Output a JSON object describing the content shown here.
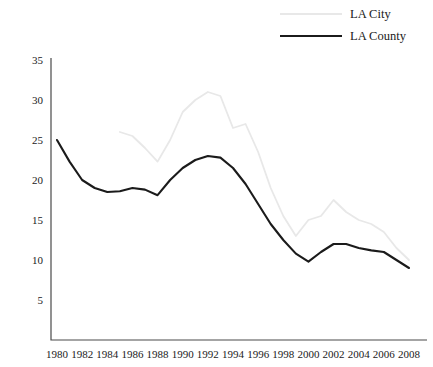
{
  "legend": {
    "items": [
      {
        "label": "LA City",
        "color": "#e8e8e8",
        "key": "la_city"
      },
      {
        "label": "LA County",
        "color": "#1b1b1b",
        "key": "la_county"
      }
    ]
  },
  "axes": {
    "y_ticks": [
      "5",
      "10",
      "15",
      "20",
      "25",
      "30",
      "35"
    ],
    "x_ticks": [
      "1980",
      "1982",
      "1984",
      "1986",
      "1988",
      "1990",
      "1992",
      "1994",
      "1996",
      "1998",
      "2000",
      "2002",
      "2004",
      "2006",
      "2008"
    ]
  },
  "chart_data": {
    "type": "line",
    "title": "",
    "xlabel": "",
    "ylabel": "",
    "xlim": [
      1980,
      2008
    ],
    "ylim": [
      0,
      35
    ],
    "ytick_values": [
      5,
      10,
      15,
      20,
      25,
      30,
      35
    ],
    "xtick_values": [
      1980,
      1982,
      1984,
      1986,
      1988,
      1990,
      1992,
      1994,
      1996,
      1998,
      2000,
      2002,
      2004,
      2006,
      2008
    ],
    "grid": false,
    "legend_position": "top-right",
    "x": [
      1980,
      1981,
      1982,
      1983,
      1984,
      1985,
      1986,
      1987,
      1988,
      1989,
      1990,
      1991,
      1992,
      1993,
      1994,
      1995,
      1996,
      1997,
      1998,
      1999,
      2000,
      2001,
      2002,
      2003,
      2004,
      2005,
      2006,
      2007,
      2008
    ],
    "series": [
      {
        "name": "LA City",
        "color": "#e8e8e8",
        "x": [
          1985,
          1986,
          1987,
          1988,
          1989,
          1990,
          1991,
          1992,
          1993,
          1994,
          1995,
          1996,
          1997,
          1998,
          1999,
          2000,
          2001,
          2002,
          2003,
          2004,
          2005,
          2006,
          2007,
          2008
        ],
        "values": [
          26.0,
          25.5,
          24.0,
          22.3,
          25.0,
          28.5,
          30.0,
          31.0,
          30.5,
          26.5,
          27.0,
          23.5,
          19.0,
          15.5,
          13.0,
          15.0,
          15.5,
          17.5,
          16.0,
          15.0,
          14.5,
          13.5,
          11.5,
          10.0
        ]
      },
      {
        "name": "LA County",
        "color": "#1b1b1b",
        "x": [
          1980,
          1981,
          1982,
          1983,
          1984,
          1985,
          1986,
          1987,
          1988,
          1989,
          1990,
          1991,
          1992,
          1993,
          1994,
          1995,
          1996,
          1997,
          1998,
          1999,
          2000,
          2001,
          2002,
          2003,
          2004,
          2005,
          2006,
          2007,
          2008
        ],
        "values": [
          25.0,
          22.3,
          20.0,
          19.0,
          18.5,
          18.6,
          19.0,
          18.8,
          18.1,
          20.0,
          21.5,
          22.5,
          23.0,
          22.8,
          21.5,
          19.5,
          17.0,
          14.5,
          12.5,
          10.8,
          9.8,
          11.0,
          12.0,
          12.0,
          11.5,
          11.2,
          11.0,
          10.0,
          9.0
        ]
      }
    ]
  }
}
